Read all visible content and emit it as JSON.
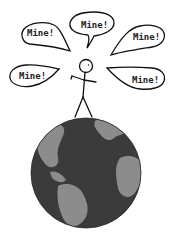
{
  "comic": {
    "speech_bubbles": [
      {
        "id": "top-left",
        "text": "Mine!"
      },
      {
        "id": "top-center",
        "text": "Mine!"
      },
      {
        "id": "top-right",
        "text": "Mine!"
      },
      {
        "id": "mid-left",
        "text": "Mine!"
      },
      {
        "id": "mid-right",
        "text": "Mine!"
      }
    ],
    "colors": {
      "ink": "#111111",
      "ocean": "#3b3b3b",
      "land": "#8c8c8c",
      "background": "#ffffff"
    }
  }
}
